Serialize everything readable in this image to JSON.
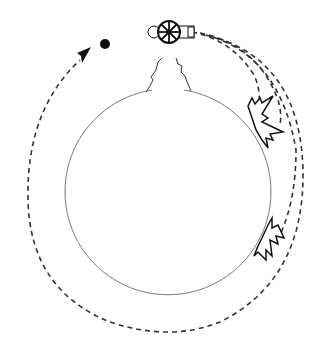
{
  "diagram": {
    "colors": {
      "background": "#ffffff",
      "earth_outline": "#7a7a7a",
      "ink": "#111111",
      "trajectory": "#333333"
    },
    "elements": {
      "earth": {
        "shape": "circle",
        "cx": 168,
        "cy": 198,
        "r": 103
      },
      "mountain": {
        "location": "top of earth"
      },
      "cannon": {
        "location": "mountain peak",
        "icon": "cannon-icon"
      },
      "cannonball": {
        "icon": "ball-icon",
        "cx": 105,
        "cy": 45
      },
      "trajectories": [
        {
          "name": "short-fall",
          "ends_at": "impact-1"
        },
        {
          "name": "medium-fall",
          "ends_at": "impact-1"
        },
        {
          "name": "long-fall",
          "ends_at": "impact-2"
        },
        {
          "name": "orbit",
          "ends_at": "arrow near ball"
        }
      ],
      "impacts": [
        {
          "name": "impact-1",
          "x": 268,
          "y": 122
        },
        {
          "name": "impact-2",
          "x": 270,
          "y": 238
        }
      ]
    }
  }
}
